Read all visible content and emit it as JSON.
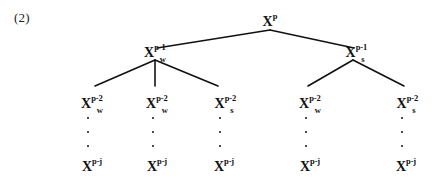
{
  "figure": {
    "equation_label": "(2)",
    "type": "tree-diagram",
    "line_color": "#111111",
    "background_color": "#ffffff",
    "text_color": "#111111"
  },
  "nodes": {
    "root": {
      "base": "X",
      "sup": "p",
      "sub": "",
      "text": "X^p",
      "x": 270,
      "y": 13
    },
    "level2": [
      {
        "base": "X",
        "sup": "p-1",
        "sub": "w",
        "text": "X_w^{p-1}",
        "x": 155,
        "y": 44
      },
      {
        "base": "X",
        "sup": "p-1",
        "sub": "s",
        "text": "X_s^{p-1}",
        "x": 355,
        "y": 44
      }
    ],
    "level3": [
      {
        "base": "X",
        "sup": "p-2",
        "sub": "w",
        "text": "X_w^{p-2}",
        "x": 92,
        "y": 95
      },
      {
        "base": "X",
        "sup": "p-2",
        "sub": "w",
        "text": "X_w^{p-2}",
        "x": 157,
        "y": 95
      },
      {
        "base": "X",
        "sup": "p-2",
        "sub": "s",
        "text": "X_s^{p-2}",
        "x": 224,
        "y": 95
      },
      {
        "base": "X",
        "sup": "p-2",
        "sub": "w",
        "text": "X_w^{p-2}",
        "x": 310,
        "y": 95
      },
      {
        "base": "X",
        "sup": "p-2",
        "sub": "s",
        "text": "X_s^{p-2}",
        "x": 406,
        "y": 95
      }
    ],
    "leaves": [
      {
        "base": "X",
        "sup": "p-j",
        "sub": "",
        "text": "X^{p-j}",
        "x": 92,
        "y": 158
      },
      {
        "base": "X",
        "sup": "p-j",
        "sub": "",
        "text": "X^{p-j}",
        "x": 157,
        "y": 158
      },
      {
        "base": "X",
        "sup": "p-j",
        "sub": "",
        "text": "X^{p-j}",
        "x": 224,
        "y": 158
      },
      {
        "base": "X",
        "sup": "p-j",
        "sub": "",
        "text": "X^{p-j}",
        "x": 310,
        "y": 158
      },
      {
        "base": "X",
        "sup": "p-j",
        "sub": "",
        "text": "X^{p-j}",
        "x": 406,
        "y": 158
      }
    ],
    "ellipsis_columns": [
      {
        "x": 88,
        "y": 117,
        "dot_count": 3
      },
      {
        "x": 153,
        "y": 117,
        "dot_count": 3
      },
      {
        "x": 220,
        "y": 117,
        "dot_count": 3
      },
      {
        "x": 306,
        "y": 117,
        "dot_count": 3
      },
      {
        "x": 402,
        "y": 117,
        "dot_count": 3
      }
    ]
  },
  "edges": [
    {
      "from": "root",
      "to": "level2-w",
      "x1": 270,
      "y1": 30,
      "x2": 157,
      "y2": 48
    },
    {
      "from": "root",
      "to": "level2-s",
      "x1": 270,
      "y1": 30,
      "x2": 354,
      "y2": 48
    },
    {
      "from": "level2-w",
      "to": "level3-0",
      "x1": 155,
      "y1": 60,
      "x2": 95,
      "y2": 86
    },
    {
      "from": "level2-w",
      "to": "level3-1",
      "x1": 155,
      "y1": 60,
      "x2": 155,
      "y2": 86
    },
    {
      "from": "level2-w",
      "to": "level3-2",
      "x1": 155,
      "y1": 60,
      "x2": 218,
      "y2": 86
    },
    {
      "from": "level2-s",
      "to": "level3-3",
      "x1": 353,
      "y1": 60,
      "x2": 308,
      "y2": 86
    },
    {
      "from": "level2-s",
      "to": "level3-4",
      "x1": 353,
      "y1": 60,
      "x2": 404,
      "y2": 86
    }
  ]
}
